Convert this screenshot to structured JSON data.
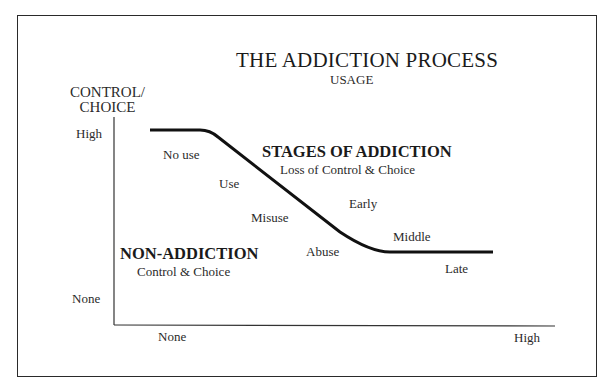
{
  "title": "THE ADDICTION PROCESS",
  "subtitle": "USAGE",
  "y_axis": {
    "label_line1": "CONTROL/",
    "label_line2": "CHOICE",
    "ticks": {
      "high": "High",
      "none": "None"
    }
  },
  "x_axis": {
    "ticks": {
      "none": "None",
      "high": "High"
    }
  },
  "regions": {
    "addiction": {
      "heading": "STAGES OF ADDICTION",
      "subheading": "Loss of Control & Choice"
    },
    "non_addiction": {
      "heading": "NON-ADDICTION",
      "subheading": "Control & Choice"
    }
  },
  "curve_labels": {
    "no_use": "No use",
    "use": "Use",
    "misuse": "Misuse",
    "abuse": "Abuse",
    "early": "Early",
    "middle": "Middle",
    "late": "Late"
  },
  "colors": {
    "line": "#111111",
    "text": "#1e1e1e",
    "background": "#ffffff"
  }
}
